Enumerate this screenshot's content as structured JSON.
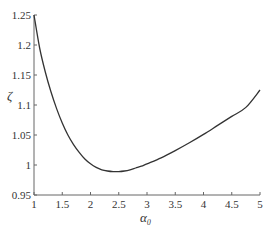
{
  "chart_data": {
    "type": "line",
    "title": "",
    "xlabel": "α₀",
    "ylabel": "ζ",
    "xlim": [
      1,
      5
    ],
    "ylim": [
      0.95,
      1.25
    ],
    "xticks": [
      1,
      1.5,
      2,
      2.5,
      3,
      3.5,
      4,
      4.5,
      5
    ],
    "xtick_labels": [
      "1",
      "1.5",
      "2",
      "2.5",
      "3",
      "3.5",
      "4",
      "4.5",
      "5"
    ],
    "yticks": [
      0.95,
      1,
      1.05,
      1.1,
      1.15,
      1.2,
      1.25
    ],
    "ytick_labels": [
      "0.95",
      "1",
      "1.05",
      "1.1",
      "1.15",
      "1.2",
      "1.25"
    ],
    "grid": false,
    "legend": null,
    "series": [
      {
        "name": "ζ(α₀)",
        "color": "#333333",
        "x": [
          1.0,
          1.1,
          1.2,
          1.3,
          1.4,
          1.5,
          1.6,
          1.7,
          1.8,
          1.9,
          2.0,
          2.1,
          2.2,
          2.3,
          2.4,
          2.5,
          2.6,
          2.7,
          2.8,
          2.9,
          3.0,
          3.25,
          3.5,
          3.75,
          4.0,
          4.25,
          4.5,
          4.75,
          5.0
        ],
        "y": [
          1.25,
          1.195,
          1.155,
          1.122,
          1.094,
          1.07,
          1.05,
          1.034,
          1.021,
          1.01,
          1.002,
          0.996,
          0.992,
          0.99,
          0.989,
          0.989,
          0.99,
          0.992,
          0.995,
          0.998,
          1.002,
          1.012,
          1.024,
          1.037,
          1.051,
          1.066,
          1.081,
          1.096,
          1.125
        ]
      }
    ]
  },
  "caption": "· · · · · · ·"
}
